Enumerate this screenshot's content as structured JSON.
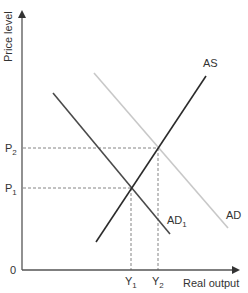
{
  "diagram": {
    "type": "AS-AD model",
    "axes": {
      "y_label": "Price level",
      "x_label": "Real output",
      "origin_label": "0"
    },
    "price_levels": [
      {
        "label": "P",
        "sub": "2",
        "y": 148
      },
      {
        "label": "P",
        "sub": "1",
        "y": 188
      }
    ],
    "output_levels": [
      {
        "label": "Y",
        "sub": "1",
        "x": 131
      },
      {
        "label": "Y",
        "sub": "2",
        "x": 158
      }
    ],
    "curves": {
      "as": {
        "label": "AS",
        "color": "#2b2b2b"
      },
      "ad1": {
        "label": "AD",
        "sub": "1",
        "color": "#4a4a4a"
      },
      "ad": {
        "label": "AD",
        "color": "#c8c8c8"
      }
    },
    "colors": {
      "axis": "#555555",
      "dashed": "#777777",
      "text": "#333333"
    }
  }
}
